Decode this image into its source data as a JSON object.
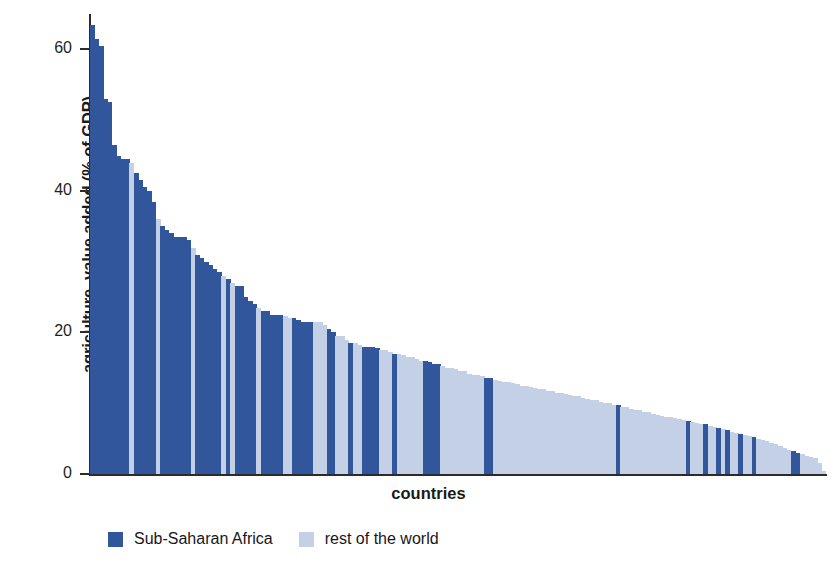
{
  "chart_data": {
    "type": "bar",
    "title": "",
    "xlabel": "countries",
    "ylabel": "agriculture, value added (% of GDP)",
    "ylim": [
      0,
      65
    ],
    "yticks": [
      0,
      20,
      40,
      60
    ],
    "ytick_labels": [
      "0",
      "20",
      "40",
      "60"
    ],
    "grid": false,
    "legend_position": "bottom-left",
    "categories_note": "individual countries, unlabeled, sorted descending by agriculture value added",
    "series": [
      {
        "name": "Sub-Saharan Africa",
        "color": "#31569c"
      },
      {
        "name": "rest of the world",
        "color": "#c3d0e6"
      }
    ],
    "bar_count": 168,
    "values": [
      63.5,
      61.5,
      60.5,
      53.0,
      52.5,
      46.5,
      45.0,
      44.5,
      44.5,
      44.0,
      42.5,
      41.5,
      40.5,
      40.0,
      38.5,
      36.0,
      35.0,
      34.5,
      34.0,
      33.5,
      33.5,
      33.5,
      33.0,
      32.0,
      31.0,
      30.5,
      30.0,
      29.5,
      29.0,
      28.5,
      28.0,
      27.5,
      27.0,
      26.5,
      26.5,
      25.0,
      24.5,
      24.0,
      23.5,
      23.0,
      23.0,
      22.5,
      22.5,
      22.5,
      22.3,
      22.0,
      22.0,
      21.8,
      21.5,
      21.5,
      21.5,
      21.5,
      21.5,
      21.0,
      20.5,
      20.0,
      19.5,
      19.5,
      19.0,
      18.5,
      18.5,
      18.3,
      18.0,
      18.0,
      18.0,
      17.8,
      17.5,
      17.5,
      17.2,
      17.0,
      17.0,
      16.8,
      16.5,
      16.5,
      16.2,
      16.0,
      16.0,
      15.8,
      15.5,
      15.5,
      15.2,
      15.0,
      15.0,
      14.8,
      14.5,
      14.5,
      14.2,
      14.0,
      14.0,
      13.8,
      13.5,
      13.5,
      13.3,
      13.2,
      13.0,
      13.0,
      12.8,
      12.7,
      12.5,
      12.5,
      12.3,
      12.2,
      12.0,
      12.0,
      11.8,
      11.7,
      11.5,
      11.5,
      11.3,
      11.2,
      11.0,
      11.0,
      10.8,
      10.6,
      10.5,
      10.4,
      10.2,
      10.0,
      10.0,
      9.8,
      9.7,
      9.5,
      9.4,
      9.2,
      9.0,
      9.0,
      8.8,
      8.7,
      8.5,
      8.4,
      8.2,
      8.0,
      8.0,
      7.9,
      7.8,
      7.6,
      7.5,
      7.4,
      7.2,
      7.0,
      7.0,
      6.8,
      6.6,
      6.5,
      6.3,
      6.2,
      6.0,
      5.8,
      5.7,
      5.5,
      5.4,
      5.2,
      5.0,
      4.8,
      4.6,
      4.4,
      4.2,
      4.0,
      3.7,
      3.4,
      3.2,
      3.0,
      2.8,
      2.6,
      2.4,
      2.2,
      1.5,
      0.4
    ],
    "groups": [
      0,
      0,
      0,
      0,
      0,
      0,
      0,
      0,
      0,
      1,
      0,
      0,
      0,
      0,
      0,
      1,
      0,
      0,
      0,
      0,
      0,
      0,
      0,
      1,
      0,
      0,
      0,
      0,
      0,
      0,
      1,
      0,
      1,
      0,
      0,
      0,
      0,
      0,
      1,
      0,
      0,
      0,
      0,
      0,
      1,
      1,
      0,
      0,
      0,
      0,
      0,
      1,
      1,
      1,
      0,
      0,
      1,
      1,
      1,
      0,
      1,
      1,
      0,
      0,
      0,
      0,
      1,
      1,
      1,
      0,
      1,
      1,
      1,
      1,
      1,
      1,
      0,
      0,
      0,
      0,
      1,
      1,
      1,
      1,
      1,
      1,
      1,
      1,
      1,
      1,
      0,
      0,
      1,
      1,
      1,
      1,
      1,
      1,
      1,
      1,
      1,
      1,
      1,
      1,
      1,
      1,
      1,
      1,
      1,
      1,
      1,
      1,
      1,
      1,
      1,
      1,
      1,
      1,
      1,
      1,
      0,
      1,
      1,
      1,
      1,
      1,
      1,
      1,
      1,
      1,
      1,
      1,
      1,
      1,
      1,
      1,
      0,
      1,
      1,
      1,
      0,
      1,
      1,
      0,
      1,
      0,
      1,
      1,
      0,
      1,
      1,
      0,
      1,
      1,
      1,
      1,
      1,
      1,
      1,
      1,
      0,
      0,
      1,
      1,
      1,
      1,
      1,
      1
    ]
  },
  "axis": {
    "ylabel": "agriculture, value added (% of GDP)",
    "xlabel": "countries",
    "ytick_labels": [
      "60",
      "40",
      "20",
      "0"
    ]
  },
  "legend": {
    "items": [
      {
        "label": "Sub-Saharan Africa",
        "color": "#31569c"
      },
      {
        "label": "rest of the world",
        "color": "#c3d0e6"
      }
    ]
  },
  "colors": {
    "sub_saharan_africa": "#31569c",
    "rest_of_world": "#c3d0e6",
    "axis": "#2b2b2b",
    "text": "#1a1a1a",
    "background": "#ffffff"
  }
}
